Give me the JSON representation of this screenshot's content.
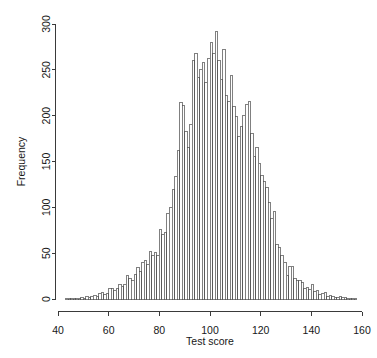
{
  "chart_data": {
    "type": "bar",
    "title": "",
    "subtitle": "",
    "xlabel": "Test score",
    "ylabel": "Frequency",
    "xlim": [
      40,
      160
    ],
    "ylim": [
      0,
      300
    ],
    "xticks": [
      40,
      60,
      80,
      100,
      120,
      140,
      160
    ],
    "xtick_labels": [
      "40",
      "60",
      "80",
      "100",
      "120",
      "140",
      "160"
    ],
    "yticks": [
      0,
      50,
      100,
      150,
      200,
      250,
      300
    ],
    "ytick_labels": [
      "0",
      "50",
      "100",
      "150",
      "200",
      "250",
      "300"
    ],
    "grid": false,
    "legend": null,
    "bin_width": 1,
    "bin_start": 43,
    "bin_end": 158,
    "bar_fill": "#ffffff",
    "bar_stroke": "#4a4a4a",
    "axis_color": "#3a3a3a",
    "categories": [
      43,
      44,
      45,
      46,
      47,
      48,
      49,
      50,
      51,
      52,
      53,
      54,
      55,
      56,
      57,
      58,
      59,
      60,
      61,
      62,
      63,
      64,
      65,
      66,
      67,
      68,
      69,
      70,
      71,
      72,
      73,
      74,
      75,
      76,
      77,
      78,
      79,
      80,
      81,
      82,
      83,
      84,
      85,
      86,
      87,
      88,
      89,
      90,
      91,
      92,
      93,
      94,
      95,
      96,
      97,
      98,
      99,
      100,
      101,
      102,
      103,
      104,
      105,
      106,
      107,
      108,
      109,
      110,
      111,
      112,
      113,
      114,
      115,
      116,
      117,
      118,
      119,
      120,
      121,
      122,
      123,
      124,
      125,
      126,
      127,
      128,
      129,
      130,
      131,
      132,
      133,
      134,
      135,
      136,
      137,
      138,
      139,
      140,
      141,
      142,
      143,
      144,
      145,
      146,
      147,
      148,
      149,
      150,
      151,
      152,
      153,
      154,
      155,
      156,
      157
    ],
    "values": [
      1,
      1,
      1,
      0,
      1,
      1,
      2,
      1,
      3,
      2,
      3,
      4,
      3,
      6,
      7,
      5,
      6,
      12,
      11,
      9,
      12,
      16,
      14,
      16,
      26,
      22,
      20,
      27,
      34,
      30,
      40,
      42,
      38,
      52,
      47,
      51,
      48,
      76,
      70,
      73,
      93,
      100,
      119,
      134,
      162,
      214,
      211,
      183,
      165,
      190,
      260,
      268,
      242,
      250,
      258,
      236,
      262,
      280,
      268,
      292,
      260,
      240,
      272,
      222,
      215,
      244,
      210,
      199,
      177,
      188,
      200,
      212,
      215,
      181,
      156,
      165,
      148,
      135,
      128,
      122,
      105,
      88,
      96,
      60,
      56,
      47,
      40,
      26,
      36,
      36,
      22,
      20,
      20,
      18,
      12,
      13,
      10,
      16,
      8,
      9,
      5,
      6,
      7,
      3,
      4,
      3,
      2,
      2,
      3,
      2,
      2,
      1,
      1,
      1,
      1
    ]
  },
  "figure": {
    "y_axis_label": "Frequency",
    "x_axis_label": "Test score"
  }
}
